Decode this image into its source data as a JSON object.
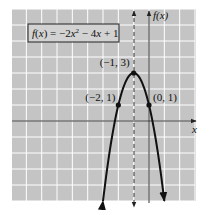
{
  "chart_data": {
    "type": "line",
    "title": "",
    "function_label": "f(x) = −2x² − 4x + 1",
    "function_label_parts": {
      "f": "f",
      "x": "x",
      "rhs_a": "−2",
      "rhs_b": "x",
      "exp": "2",
      "rhs_c": " − 4",
      "rhs_d": "x",
      "rhs_e": " + 1"
    },
    "xlabel": "x",
    "ylabel": "f(x)",
    "xlim": [
      -9,
      3
    ],
    "ylim": [
      -5,
      7
    ],
    "grid": true,
    "axis_of_symmetry": {
      "x": -1,
      "style": "dashed"
    },
    "series": [
      {
        "name": "f(x) = -2x^2 - 4x + 1",
        "a": -2,
        "b": -4,
        "c": 1,
        "x": [
          -3,
          -2.5,
          -2,
          -1.5,
          -1,
          -0.5,
          0,
          0.5,
          1
        ],
        "y": [
          -5,
          -1.5,
          1,
          2.5,
          3,
          2.5,
          1,
          -1.5,
          -5
        ]
      }
    ],
    "points": [
      {
        "x": -1,
        "y": 3,
        "label": "(−1, 3)"
      },
      {
        "x": -2,
        "y": 1,
        "label": "(−2, 1)"
      },
      {
        "x": 0,
        "y": 1,
        "label": "(0, 1)"
      }
    ]
  },
  "colors": {
    "grid_background": "#c4c4c4",
    "grid_lines": "#ffffff",
    "curve": "#111111",
    "axes": "#333333",
    "box_background": "#d2d2d2"
  }
}
